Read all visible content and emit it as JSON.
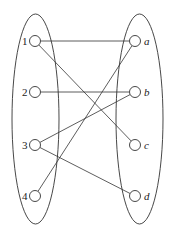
{
  "graph": {
    "type": "bipartite",
    "left_set": [
      {
        "id": "1",
        "label": "1",
        "x": 35,
        "y": 41
      },
      {
        "id": "2",
        "label": "2",
        "x": 35,
        "y": 92
      },
      {
        "id": "3",
        "label": "3",
        "x": 35,
        "y": 145
      },
      {
        "id": "4",
        "label": "4",
        "x": 35,
        "y": 196
      }
    ],
    "right_set": [
      {
        "id": "a",
        "label": "a",
        "x": 135,
        "y": 41
      },
      {
        "id": "b",
        "label": "b",
        "x": 135,
        "y": 92
      },
      {
        "id": "c",
        "label": "c",
        "x": 135,
        "y": 145
      },
      {
        "id": "d",
        "label": "d",
        "x": 135,
        "y": 196
      }
    ],
    "edges": [
      [
        "1",
        "a"
      ],
      [
        "1",
        "c"
      ],
      [
        "2",
        "b"
      ],
      [
        "3",
        "b"
      ],
      [
        "3",
        "d"
      ],
      [
        "4",
        "a"
      ]
    ],
    "colors": {
      "stroke": "#333333",
      "background": "#ffffff"
    }
  }
}
